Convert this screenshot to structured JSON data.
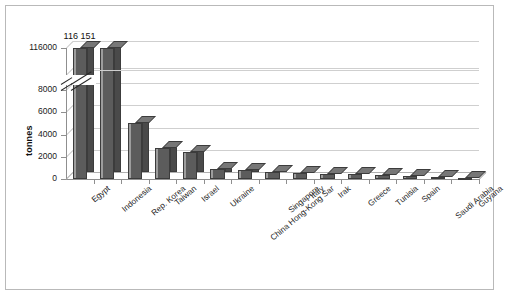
{
  "chart_data": {
    "type": "bar",
    "title": "",
    "subtitle": "",
    "xlabel": "",
    "ylabel": "tonnes",
    "categories": [
      "Egypt",
      "Indonesia",
      "Rep. Korea",
      "Taiwan",
      "Israel",
      "Ukraine",
      "China Hong-Kong Sar",
      "Singapore",
      "Italy",
      "Irak",
      "Greece",
      "Tunisia",
      "Spain",
      "Saudi Arabia",
      "Guyana"
    ],
    "values": [
      116151,
      8100,
      5000,
      2800,
      2400,
      900,
      850,
      600,
      520,
      470,
      420,
      330,
      280,
      170,
      120
    ],
    "data_labels": [
      {
        "category": "Egypt",
        "text": "116 151"
      }
    ],
    "ytick_labels": [
      "0",
      "2000",
      "4000",
      "6000",
      "8000",
      "116000"
    ],
    "ytick_values": [
      0,
      2000,
      4000,
      6000,
      8000,
      116000
    ],
    "ylim": [
      0,
      116151
    ],
    "axis_break": true,
    "axis_break_between": [
      8000,
      116000
    ],
    "grid": true,
    "grid_axis": "y",
    "legend": false,
    "legend_position": "none",
    "style_3d": true,
    "colors": {
      "bar_front": "#5c5c5c",
      "bar_top": "#777777",
      "bar_side": "#4a4a4a",
      "bar_outline": "#3c3c3c",
      "gridline": "#c8c8c8",
      "axis": "#8f8f8f",
      "text": "#1a1a1a",
      "background": "#ffffff",
      "frame_border": "#b9b9b9"
    }
  }
}
